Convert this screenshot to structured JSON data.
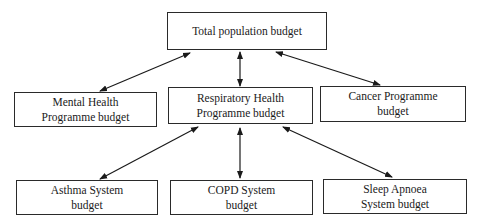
{
  "diagram": {
    "type": "hierarchy",
    "nodes": [
      {
        "id": "total",
        "lines": [
          "Total population budget"
        ]
      },
      {
        "id": "mental",
        "lines": [
          "Mental Health",
          "Programme budget"
        ]
      },
      {
        "id": "respiratory",
        "lines": [
          "Respiratory Health",
          "Programme budget"
        ]
      },
      {
        "id": "cancer",
        "lines": [
          "Cancer Programme",
          "budget"
        ]
      },
      {
        "id": "asthma",
        "lines": [
          "Asthma System",
          "budget"
        ]
      },
      {
        "id": "copd",
        "lines": [
          "COPD System",
          "budget"
        ]
      },
      {
        "id": "sleep",
        "lines": [
          "Sleep Apnoea",
          "System budget"
        ]
      }
    ],
    "edges": [
      {
        "from": "total",
        "to": "mental",
        "bidirectional": true
      },
      {
        "from": "total",
        "to": "respiratory",
        "bidirectional": true
      },
      {
        "from": "total",
        "to": "cancer",
        "bidirectional": true
      },
      {
        "from": "respiratory",
        "to": "asthma",
        "bidirectional": true
      },
      {
        "from": "respiratory",
        "to": "copd",
        "bidirectional": true
      },
      {
        "from": "respiratory",
        "to": "sleep",
        "bidirectional": true
      }
    ]
  }
}
